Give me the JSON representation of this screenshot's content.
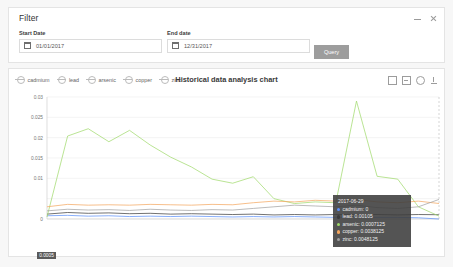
{
  "filter": {
    "title": "Filter",
    "start_label": "Start Date",
    "start_value": "01/01/2017",
    "end_label": "End date",
    "end_value": "12/31/2017",
    "query_label": "Query",
    "minimize_icon": "minimize-icon",
    "close_icon": "close-icon",
    "calendar_icon": "calendar-icon"
  },
  "chart_panel": {
    "title": "Historical data analysis chart",
    "toolbox": [
      {
        "name": "zoom-rect-icon",
        "label": "Zoom"
      },
      {
        "name": "zoom-back-icon",
        "label": "Zoom reset"
      },
      {
        "name": "restore-icon",
        "label": "Restore"
      },
      {
        "name": "download-icon",
        "label": "Save as image"
      }
    ]
  },
  "tooltip": {
    "date": "2017-06-29",
    "rows": [
      {
        "name": "cadmium",
        "value": "0",
        "color": "#5b8ff9"
      },
      {
        "name": "lead",
        "value": "0.00105",
        "color": "#3a3a3a"
      },
      {
        "name": "arsenic",
        "value": "0.0007125",
        "color": "#9fd96a"
      },
      {
        "name": "copper",
        "value": "0.0038125",
        "color": "#f4a65e"
      },
      {
        "name": "zinc",
        "value": "0.0048125",
        "color": "#a0a0a0"
      }
    ]
  },
  "axis_markers": {
    "y_value": "0.0005",
    "x_value": "2017-06-29"
  },
  "chart_data": {
    "type": "line",
    "title": "Historical data analysis chart",
    "xlabel": "",
    "ylabel": "",
    "ylim": [
      0,
      0.03
    ],
    "yticks": [
      "0",
      "0.005",
      "0.01",
      "0.015",
      "0.02",
      "0.025",
      "0.03"
    ],
    "ytick_values": [
      0,
      0.005,
      0.01,
      0.015,
      0.02,
      0.025,
      0.03
    ],
    "grid": true,
    "legend_position": "top-left",
    "xticks": [
      "2017-04-26",
      "2017-05-03",
      "2017-05-10",
      "2017-05-17",
      "2017-05-24",
      "2017-05-31",
      "2017-06-07",
      "2017-06-14",
      "2017-06-21",
      "2017-06-29"
    ],
    "x": [
      "2017-04-22",
      "2017-04-26",
      "2017-04-29",
      "2017-05-03",
      "2017-05-06",
      "2017-05-10",
      "2017-05-13",
      "2017-05-17",
      "2017-05-20",
      "2017-05-24",
      "2017-05-27",
      "2017-05-31",
      "2017-06-03",
      "2017-06-07",
      "2017-06-10",
      "2017-06-14",
      "2017-06-17",
      "2017-06-21",
      "2017-06-25",
      "2017-06-29"
    ],
    "series": [
      {
        "name": "cadmium",
        "color": "#5b8ff9",
        "values": [
          0.0008,
          0.0009,
          0.0007,
          0.0008,
          0.0006,
          0.0007,
          0.0006,
          0.0007,
          0.0006,
          0.0005,
          0.0006,
          0.0005,
          0.0006,
          0.0005,
          0.0004,
          0.0005,
          0.0004,
          0.0004,
          0.0003,
          0
        ]
      },
      {
        "name": "lead",
        "color": "#3a3a3a",
        "values": [
          0.0012,
          0.0016,
          0.0014,
          0.0015,
          0.0013,
          0.0014,
          0.0012,
          0.0013,
          0.0012,
          0.0011,
          0.0012,
          0.001,
          0.0011,
          0.001,
          0.0011,
          0.001,
          0.0011,
          0.001,
          0.0011,
          0.00105
        ]
      },
      {
        "name": "arsenic",
        "color": "#9fd96a",
        "values": [
          0.0005,
          0.0204,
          0.0222,
          0.019,
          0.0218,
          0.0182,
          0.0152,
          0.0128,
          0.0098,
          0.0088,
          0.0104,
          0.005,
          0.0038,
          0.0042,
          0.004,
          0.029,
          0.0105,
          0.0098,
          0.003,
          0.0007125
        ]
      },
      {
        "name": "copper",
        "color": "#f4a65e",
        "values": [
          0.003,
          0.0036,
          0.0034,
          0.0035,
          0.0034,
          0.0036,
          0.0035,
          0.0034,
          0.0036,
          0.0035,
          0.004,
          0.0044,
          0.0042,
          0.0046,
          0.0044,
          0.0048,
          0.0042,
          0.004,
          0.0044,
          0.0038125
        ]
      },
      {
        "name": "zinc",
        "color": "#a0a0a0",
        "values": [
          0.002,
          0.0024,
          0.0022,
          0.0023,
          0.0021,
          0.0024,
          0.0022,
          0.0021,
          0.0023,
          0.0022,
          0.0026,
          0.003,
          0.0034,
          0.0032,
          0.003,
          0.0034,
          0.0028,
          0.0026,
          0.003,
          0.0048125
        ]
      }
    ]
  },
  "datazoom": {
    "start_percent": 29,
    "end_percent": 47
  }
}
